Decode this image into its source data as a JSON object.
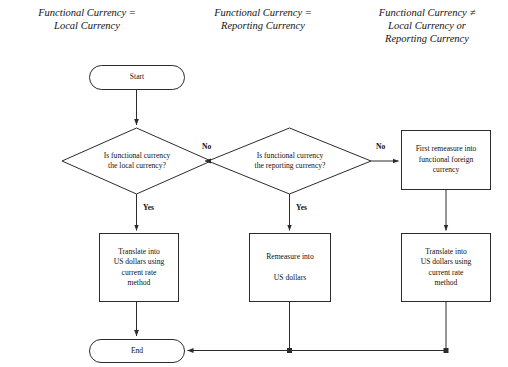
{
  "diagram": {
    "stroke_color": "#2b2b2b",
    "background_color": "#ffffff",
    "headings": [
      {
        "id": "local",
        "text": "Functional Currency =\nLocal Currency"
      },
      {
        "id": "reporting",
        "text": "Functional Currency =\nReporting Currency"
      },
      {
        "id": "neither",
        "text": "Functional Currency ≠\nLocal Currency or\nReporting Currency"
      }
    ],
    "nodes": [
      {
        "id": "start",
        "type": "terminal",
        "label": "Start"
      },
      {
        "id": "decision-local",
        "type": "decision",
        "label": "Is functional currency\nthe local currency?"
      },
      {
        "id": "decision-reporting",
        "type": "decision",
        "label": "Is functional currency\nthe reporting currency?"
      },
      {
        "id": "first-remeasure",
        "type": "process",
        "label": "First remeasure into\nfunctional foreign\ncurrency"
      },
      {
        "id": "translate-left",
        "type": "process",
        "label": "Translate into\nUS dollars using\ncurrent rate\nmethod"
      },
      {
        "id": "remeasure-middle",
        "type": "process",
        "label": "Remeasure into\n\nUS dollars"
      },
      {
        "id": "translate-right",
        "type": "process",
        "label": "Translate into\nUS dollars using\ncurrent rate\nmethod"
      },
      {
        "id": "end",
        "type": "terminal",
        "label": "End"
      }
    ],
    "edge_labels": [
      {
        "id": "no-1",
        "text": "No"
      },
      {
        "id": "yes-1",
        "text": "Yes"
      },
      {
        "id": "no-2",
        "text": "No"
      },
      {
        "id": "yes-2",
        "text": "Yes"
      }
    ]
  }
}
